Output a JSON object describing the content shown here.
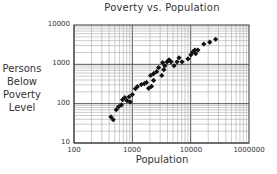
{
  "chart_data": {
    "type": "scatter",
    "title": "Poverty vs. Population",
    "xlabel": "Population",
    "ylabel": "Persons Below Poverty Level",
    "ylabel_lines": [
      "Persons",
      "Below",
      "Poverty",
      "Level"
    ],
    "x_scale": "log",
    "y_scale": "log",
    "xlim": [
      100,
      100000
    ],
    "ylim": [
      10,
      10000
    ],
    "x_tick_labels": [
      "100",
      "1000",
      "10000",
      "1000000"
    ],
    "y_tick_labels": [
      "10",
      "100",
      "1000",
      "10000"
    ],
    "grid": true,
    "legend": "none",
    "marker": "filled diamond",
    "series": [
      {
        "name": "Counties",
        "points": [
          [
            430,
            46
          ],
          [
            470,
            39
          ],
          [
            530,
            70
          ],
          [
            580,
            83
          ],
          [
            650,
            93
          ],
          [
            680,
            126
          ],
          [
            740,
            142
          ],
          [
            810,
            119
          ],
          [
            880,
            150
          ],
          [
            920,
            111
          ],
          [
            1000,
            170
          ],
          [
            1130,
            240
          ],
          [
            1220,
            270
          ],
          [
            1430,
            305
          ],
          [
            1610,
            325
          ],
          [
            1750,
            345
          ],
          [
            1900,
            245
          ],
          [
            2130,
            275
          ],
          [
            2310,
            390
          ],
          [
            2050,
            520
          ],
          [
            2310,
            580
          ],
          [
            2610,
            650
          ],
          [
            2820,
            820
          ],
          [
            3190,
            520
          ],
          [
            3460,
            730
          ],
          [
            3310,
            1100
          ],
          [
            3610,
            920
          ],
          [
            3940,
            1160
          ],
          [
            4260,
            1300
          ],
          [
            4620,
            1160
          ],
          [
            5200,
            920
          ],
          [
            5840,
            1160
          ],
          [
            6320,
            1460
          ],
          [
            7110,
            1160
          ],
          [
            9000,
            1380
          ],
          [
            10100,
            1740
          ],
          [
            10900,
            2070
          ],
          [
            11800,
            2300
          ],
          [
            12200,
            1860
          ],
          [
            13300,
            2300
          ],
          [
            16800,
            3270
          ],
          [
            21200,
            3650
          ],
          [
            26800,
            4340
          ]
        ]
      }
    ]
  }
}
